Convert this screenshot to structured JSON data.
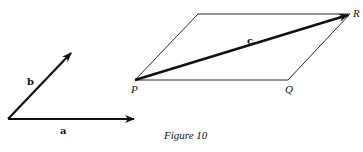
{
  "figure": {
    "caption": "Figure 10",
    "vectors_left": {
      "a_label": "a",
      "b_label": "b"
    },
    "parallelogram": {
      "P_label": "P",
      "Q_label": "Q",
      "R_label": "R",
      "c_label": "c"
    },
    "colors": {
      "ink": "#111111",
      "background": "#ffffff"
    }
  }
}
